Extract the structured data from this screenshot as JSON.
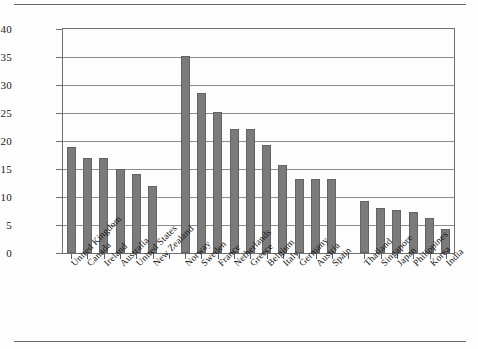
{
  "chart_data": {
    "type": "bar",
    "title": "",
    "subtitle": "",
    "xlabel": "",
    "ylabel": "",
    "ylim": [
      0,
      40
    ],
    "ytick_step": 5,
    "yticks": [
      0,
      5,
      10,
      15,
      20,
      25,
      30,
      35,
      40
    ],
    "grid": true,
    "legend": "none",
    "bar_color": "#7b7b7b",
    "bar_edge_color": "#636363",
    "axis_color": "#6f6f6f",
    "gridline_color": "#8d8d8d",
    "categories": [
      "United Kingdom",
      "Canada",
      "Ireland",
      "Australia",
      "United States",
      "New Zealand",
      "Norway",
      "Sweden",
      "France",
      "Netherlands",
      "Greece",
      "Belgium",
      "Italy",
      "Germany",
      "Austria",
      "Spain",
      "Thailand",
      "Singapore",
      "Japan",
      "Philippines",
      "Korea",
      "India"
    ],
    "values": [
      19.0,
      16.9,
      17.0,
      15.0,
      14.1,
      12.0,
      35.1,
      28.6,
      25.1,
      22.1,
      22.1,
      19.3,
      15.7,
      13.2,
      13.2,
      13.2,
      9.2,
      8.1,
      7.7,
      7.3,
      6.2,
      4.3
    ],
    "groups": [
      {
        "name": "group-1",
        "categories": [
          "United Kingdom",
          "Canada",
          "Ireland",
          "Australia",
          "United States",
          "New Zealand"
        ]
      },
      {
        "name": "group-2",
        "categories": [
          "Norway",
          "Sweden",
          "France",
          "Netherlands",
          "Greece",
          "Belgium",
          "Italy",
          "Germany",
          "Austria",
          "Spain"
        ]
      },
      {
        "name": "group-3",
        "categories": [
          "Thailand",
          "Singapore",
          "Japan",
          "Philippines",
          "Korea",
          "India"
        ]
      }
    ],
    "slot_count": 24,
    "empty_slot_indices": [
      6,
      17
    ]
  }
}
